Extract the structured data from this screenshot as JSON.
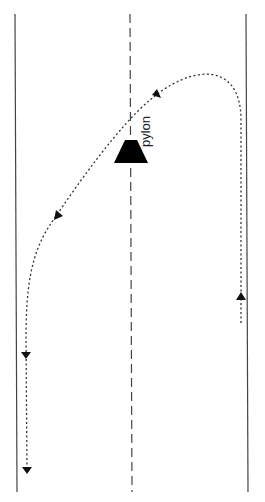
{
  "diagram": {
    "type": "road-manoeuvre",
    "labels": {
      "obstacle": "pylon"
    },
    "colors": {
      "line": "#444444",
      "path": "#333333",
      "obstacle": "#000000",
      "background": "#ffffff"
    },
    "elements": [
      {
        "id": "left-edge",
        "kind": "solid-line"
      },
      {
        "id": "center-line",
        "kind": "dashed-line"
      },
      {
        "id": "right-edge",
        "kind": "solid-line"
      },
      {
        "id": "pylon",
        "kind": "trapezoid"
      },
      {
        "id": "path",
        "kind": "dotted-curve",
        "arrows": 5
      }
    ]
  }
}
